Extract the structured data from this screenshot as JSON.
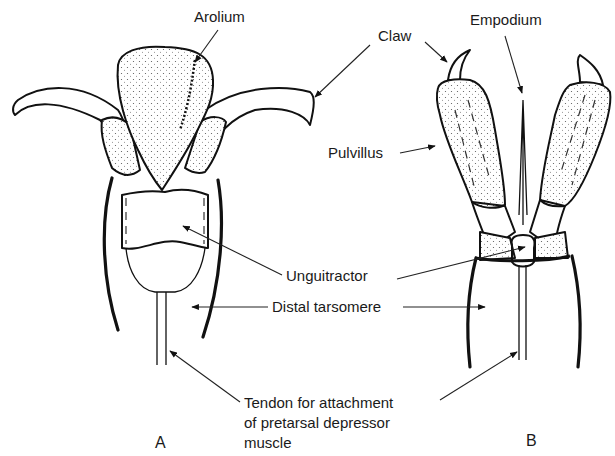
{
  "figure": {
    "panels": [
      {
        "id": "A",
        "label": "A"
      },
      {
        "id": "B",
        "label": "B"
      }
    ],
    "labels": {
      "arolium": "Arolium",
      "claw": "Claw",
      "empodium": "Empodium",
      "pulvillus": "Pulvillus",
      "unguitractor": "Unguitractor",
      "distal_tarsomere": "Distal tarsomere",
      "tendon_line1": "Tendon for attachment",
      "tendon_line2": "of pretarsal depressor",
      "tendon_line3": "muscle"
    },
    "colors": {
      "ink": "#111111",
      "background": "#ffffff"
    }
  }
}
